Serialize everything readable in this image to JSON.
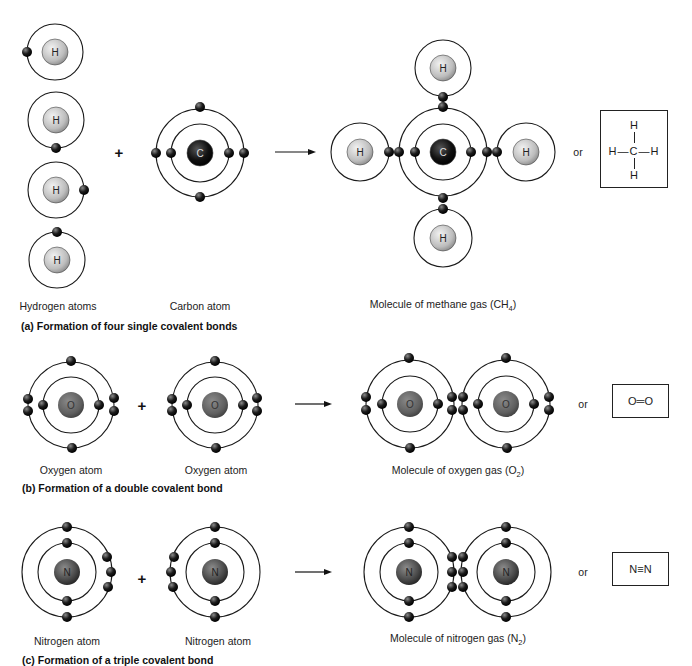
{
  "section_a": {
    "caption": "(a) Formation of four single covalent bonds",
    "reactant_labels": [
      "Hydrogen atoms",
      "Carbon atom"
    ],
    "product_label_prefix": "Molecule of methane gas (CH",
    "product_label_sub": "4",
    "product_label_suffix": ")",
    "or_text": "or",
    "structural_formula": {
      "top": "H",
      "middle": "H—C—H",
      "bottom": "H"
    },
    "atom_symbols": {
      "hydrogen": "H",
      "carbon": "C"
    }
  },
  "section_b": {
    "caption": "(b) Formation of a double covalent bond",
    "reactant_labels": [
      "Oxygen atom",
      "Oxygen atom"
    ],
    "product_label_prefix": "Molecule of oxygen gas (O",
    "product_label_sub": "2",
    "product_label_suffix": ")",
    "or_text": "or",
    "structural_formula": "O═O",
    "atom_symbol": "O"
  },
  "section_c": {
    "caption": "(c) Formation of a triple covalent bond",
    "reactant_labels": [
      "Nitrogen atom",
      "Nitrogen atom"
    ],
    "product_label_prefix": "Molecule of nitrogen gas (N",
    "product_label_sub": "2",
    "product_label_suffix": ")",
    "or_text": "or",
    "structural_formula": "N≡N",
    "atom_symbol": "N"
  },
  "operators": {
    "plus": "+"
  },
  "colors": {
    "hydrogen_nucleus": "#bdbdbd",
    "carbon_nucleus": "#111111",
    "oxygen_nucleus": "#5f5f5f",
    "nitrogen_nucleus": "#4a4a4a",
    "electron": "#1c1c1c",
    "orbit": "#1a1a1a"
  }
}
